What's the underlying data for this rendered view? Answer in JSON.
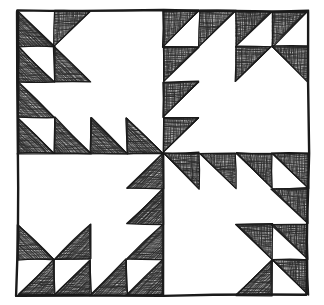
{
  "figure": {
    "kind": "line-drawing",
    "canvas": {
      "width": 324,
      "height": 305,
      "background": "#ffffff"
    }
  },
  "style": {
    "ink_color": "#1a1a1a",
    "hatch_color": "#2b2b2b",
    "paper_color": "#ffffff",
    "outer_stroke_width": 2.4,
    "cell_stroke_width": 1.3,
    "hatch_stroke_width": 0.55
  },
  "block": {
    "outer_frame": {
      "x": 18,
      "y": 11,
      "width": 290,
      "height": 284
    },
    "center": {
      "x": 163,
      "y": 153
    },
    "quadrant_grid": 4,
    "quadrants": [
      {
        "name": "top-left",
        "rotation_deg": 0,
        "x": 18,
        "y": 11,
        "width": 145,
        "height": 142
      },
      {
        "name": "top-right",
        "rotation_deg": 90,
        "x": 163,
        "y": 11,
        "width": 145,
        "height": 142
      },
      {
        "name": "bottom-right",
        "rotation_deg": 180,
        "x": 163,
        "y": 153,
        "width": 145,
        "height": 142
      },
      {
        "name": "bottom-left",
        "rotation_deg": 270,
        "x": 18,
        "y": 153,
        "width": 145,
        "height": 142
      }
    ],
    "unit_map_legend": {
      "0": "blank / background square",
      "1": "filled triangle, hypotenuse from top-left to bottom-right, ink in lower-left half",
      "2": "filled triangle, hypotenuse from top-right to bottom-left, ink in lower-right half",
      "3": "filled triangle, hypotenuse from top-left to bottom-right, ink in upper-right half",
      "4": "filled triangle, hypotenuse from top-right to bottom-left, ink in upper-left half"
    },
    "quadrant_unit_map": [
      [
        1,
        4,
        0,
        0
      ],
      [
        1,
        1,
        0,
        0
      ],
      [
        1,
        0,
        0,
        0
      ],
      [
        1,
        1,
        1,
        1
      ]
    ],
    "notes": "The top-left quadrant map is rotated 90/180/270 degrees to build the remaining three quadrants, producing the pinwheel symmetry seen in the drawing."
  },
  "chart_data": {
    "type": "table",
    "categories": [
      "col 1",
      "col 2",
      "col 3",
      "col 4"
    ],
    "rows": [
      "row 1",
      "row 2",
      "row 3",
      "row 4"
    ],
    "values": [
      [
        1,
        4,
        0,
        0
      ],
      [
        1,
        1,
        0,
        0
      ],
      [
        1,
        0,
        0,
        0
      ],
      [
        1,
        1,
        1,
        1
      ]
    ],
    "xlabel": "column",
    "ylabel": "row",
    "legend": [
      "0 = plain white square",
      "1 = shaded triangle, lower-left",
      "2 = shaded triangle, lower-right",
      "3 = shaded triangle, upper-right",
      "4 = shaded triangle, upper-left"
    ]
  }
}
